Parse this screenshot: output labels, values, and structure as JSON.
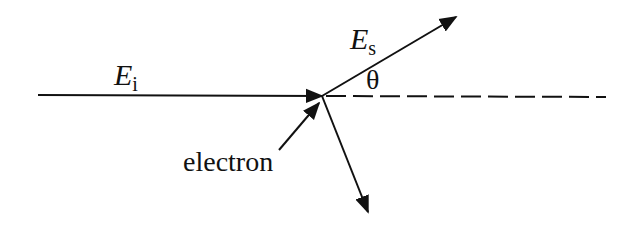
{
  "diagram": {
    "type": "scattering",
    "labels": {
      "incident": {
        "symbol": "E",
        "subscript": "i"
      },
      "scattered": {
        "symbol": "E",
        "subscript": "s"
      },
      "angle": "θ",
      "particle": "electron"
    },
    "colors": {
      "line": "#111111",
      "background": "#ffffff"
    }
  }
}
